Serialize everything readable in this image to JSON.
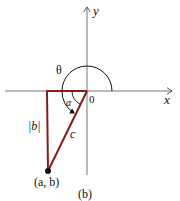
{
  "labels": {
    "y_axis": "y",
    "x_axis": "x",
    "origin": "0",
    "theta": "θ",
    "alpha": "α",
    "b_abs": "|b|",
    "c": "c",
    "point": "(a, b)",
    "caption": "(b)"
  },
  "colors": {
    "triangle": "#8b1a1a",
    "axes": "#555555",
    "ink": "#111111"
  }
}
